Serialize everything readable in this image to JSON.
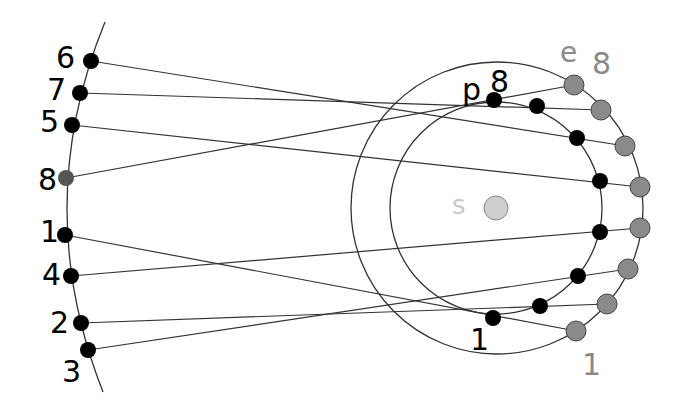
{
  "diagram": {
    "title": "",
    "colors": {
      "line": "#333333",
      "planet_dot": "#000000",
      "earth_dot": "#8a8a8a",
      "earth_dot_stroke": "#444444",
      "sun_fill": "#cfcfcf",
      "sun_label": "#c8c8c8",
      "earth_label": "#8a8a8a",
      "planet_label": "#000000",
      "left_dot_8": "#555555"
    },
    "sun": {
      "label": "s",
      "cx": 496,
      "cy": 208,
      "r": 12
    },
    "orbits": {
      "inner": {
        "name": "planet-orbit",
        "cx": 496,
        "cy": 208,
        "r": 106
      },
      "outer": {
        "name": "earth-orbit",
        "cx": 497,
        "cy": 208,
        "r": 146
      }
    },
    "left_arc": {
      "d": "M105,22 Q30,206 103,392"
    },
    "labels": {
      "planet_marker": "p",
      "planet_index": "8",
      "earth_marker": "e",
      "earth_index": "8",
      "planet_start": "1",
      "earth_start": "1"
    },
    "sightlines": [
      {
        "id": "1",
        "left": [
          65,
          235
        ],
        "planet": [
          493,
          318
        ],
        "earth": [
          576,
          331
        ]
      },
      {
        "id": "2",
        "left": [
          81,
          323
        ],
        "planet": [
          540,
          306
        ],
        "earth": [
          607,
          304
        ]
      },
      {
        "id": "3",
        "left": [
          88,
          350
        ],
        "planet": [
          578,
          276
        ],
        "earth": [
          628,
          269
        ]
      },
      {
        "id": "4",
        "left": [
          71,
          276
        ],
        "planet": [
          600,
          232
        ],
        "earth": [
          640,
          228
        ]
      },
      {
        "id": "5",
        "left": [
          72,
          125
        ],
        "planet": [
          600,
          181
        ],
        "earth": [
          640,
          187
        ]
      },
      {
        "id": "6",
        "left": [
          91,
          61
        ],
        "planet": [
          577,
          138
        ],
        "earth": [
          625,
          146
        ]
      },
      {
        "id": "7",
        "left": [
          80,
          93
        ],
        "planet": [
          537,
          106
        ],
        "earth": [
          601,
          110
        ]
      },
      {
        "id": "8",
        "left": [
          66,
          178
        ],
        "planet": [
          494,
          100
        ],
        "earth": [
          574,
          85
        ]
      }
    ],
    "left_labels": [
      {
        "text": "6",
        "x": 56,
        "y": 68
      },
      {
        "text": "7",
        "x": 47,
        "y": 100
      },
      {
        "text": "5",
        "x": 40,
        "y": 132
      },
      {
        "text": "8",
        "x": 38,
        "y": 190
      },
      {
        "text": "1",
        "x": 40,
        "y": 242
      },
      {
        "text": "4",
        "x": 42,
        "y": 285
      },
      {
        "text": "2",
        "x": 50,
        "y": 333
      },
      {
        "text": "3",
        "x": 62,
        "y": 382
      }
    ]
  }
}
